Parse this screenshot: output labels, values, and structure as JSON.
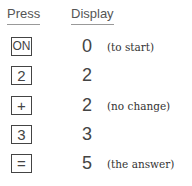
{
  "headers": {
    "press": "Press",
    "display": "Display"
  },
  "rows": [
    {
      "key": "ON",
      "display": "0",
      "note": "(to start)"
    },
    {
      "key": "2",
      "display": "2",
      "note": ""
    },
    {
      "key": "+",
      "display": "2",
      "note": "(no change)"
    },
    {
      "key": "3",
      "display": "3",
      "note": ""
    },
    {
      "key": "=",
      "display": "5",
      "note": "(the answer)"
    }
  ]
}
